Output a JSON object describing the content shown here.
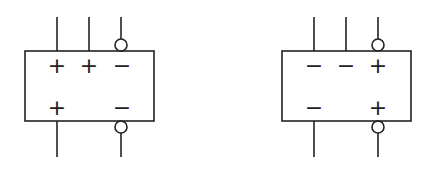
{
  "diagram": {
    "stroke_color": "#222222",
    "background": "#ffffff",
    "blocks": [
      {
        "id": "left",
        "top_signs": [
          "+",
          "+",
          "−"
        ],
        "bottom_signs": [
          "+",
          "−"
        ],
        "top_terminals": 3,
        "bottom_terminals": 2,
        "inverted_terminals": [
          "top-right",
          "bottom-right"
        ]
      },
      {
        "id": "right",
        "top_signs": [
          "−",
          "−",
          "+"
        ],
        "bottom_signs": [
          "−",
          "+"
        ],
        "top_terminals": 3,
        "bottom_terminals": 2,
        "inverted_terminals": [
          "top-right",
          "bottom-right"
        ]
      }
    ]
  }
}
